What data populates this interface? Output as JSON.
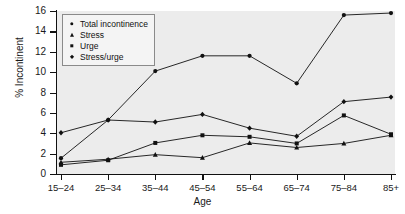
{
  "chart_data": {
    "type": "line",
    "title": "",
    "xlabel": "Age",
    "ylabel": "% Incontinent",
    "categories": [
      "15–24",
      "25–34",
      "35–44",
      "45–54",
      "55–64",
      "65–74",
      "75–84",
      "85+"
    ],
    "yticks": [
      0,
      2,
      4,
      6,
      8,
      10,
      12,
      14,
      16
    ],
    "ylim": [
      0,
      16
    ],
    "grid": false,
    "legend_position": "top-left",
    "plot_background": "#ececec",
    "line_color": "#111111",
    "series": [
      {
        "name": "Total incontinence",
        "marker": "circle",
        "values": [
          1.55,
          5.3,
          10.1,
          11.6,
          11.6,
          8.9,
          15.6,
          15.8
        ]
      },
      {
        "name": "Stress",
        "marker": "triangle",
        "values": [
          1.15,
          1.45,
          1.9,
          1.6,
          3.05,
          2.6,
          3.0,
          3.8
        ]
      },
      {
        "name": "Urge",
        "marker": "square",
        "values": [
          0.9,
          1.35,
          3.05,
          3.8,
          3.65,
          3.0,
          5.75,
          3.9
        ]
      },
      {
        "name": "Stress/urge",
        "marker": "diamond",
        "values": [
          4.05,
          5.3,
          5.1,
          5.85,
          4.5,
          3.7,
          7.1,
          7.55
        ]
      }
    ]
  }
}
